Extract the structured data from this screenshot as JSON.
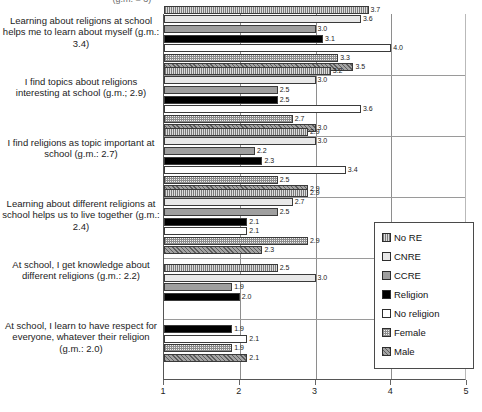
{
  "clipped_title": "(g.m. = 3)",
  "chart_data": {
    "type": "bar",
    "orientation": "horizontal",
    "title": "",
    "xlabel": "",
    "ylabel": "",
    "xlim": [
      1,
      5
    ],
    "xticks": [
      "1",
      "2",
      "3",
      "4",
      "5"
    ],
    "grid": true,
    "legend_position": "right",
    "legend": [
      "No RE",
      "CNRE",
      "CCRE",
      "Religion",
      "No religion",
      "Female",
      "Male"
    ],
    "series_order": [
      "No RE",
      "CNRE",
      "CCRE",
      "Religion",
      "No religion",
      "Female",
      "Male"
    ],
    "categories": [
      "Learning about religions at school helps me to learn about myself (g.m.: 3.4)",
      "I find topics about religions interesting at school (g.m.; 2.9)",
      "I find religions as topic important at school (g.m.: 2.7)",
      "Learning about different religions at school helps us to live together (g.m.: 2.4)",
      "At school, I get knowledge about different religions (g.m.: 2.2)",
      "At school, I learn to have respect for everyone, whatever their religion (g.m.: 2.0)"
    ],
    "series": [
      {
        "name": "No RE",
        "values": [
          3.7,
          3.2,
          2.9,
          2.9,
          3.0,
          2.1
        ]
      },
      {
        "name": "CNRE",
        "values": [
          3.6,
          3.0,
          3.0,
          2.7,
          1.9,
          1.9
        ]
      },
      {
        "name": "CCRE",
        "values": [
          3.0,
          2.5,
          2.2,
          2.5,
          2.0,
          2.1
        ]
      },
      {
        "name": "Religion",
        "values": [
          3.1,
          2.5,
          2.3,
          2.1,
          null,
          1.9
        ]
      },
      {
        "name": "No religion",
        "values": [
          4.0,
          3.6,
          3.4,
          2.1,
          null,
          2.1
        ]
      },
      {
        "name": "Female",
        "values": [
          3.3,
          2.7,
          2.5,
          2.9,
          null,
          null
        ]
      },
      {
        "name": "Male",
        "values": [
          3.5,
          3.0,
          2.9,
          2.5,
          null,
          null
        ]
      }
    ],
    "groups": [
      {
        "label": "Learning about religions at school helps me to learn about myself (g.m.: 3.4)",
        "bars": [
          {
            "series": "No RE",
            "value": 3.7,
            "label": "3.7"
          },
          {
            "series": "CNRE",
            "value": 3.6,
            "label": "3.6"
          },
          {
            "series": "CCRE",
            "value": 3.0,
            "label": "3.0"
          },
          {
            "series": "Religion",
            "value": 3.1,
            "label": "3.1"
          },
          {
            "series": "No religion",
            "value": 4.0,
            "label": "4.0"
          },
          {
            "series": "Female",
            "value": 3.3,
            "label": "3.3"
          },
          {
            "series": "Male",
            "value": 3.5,
            "label": "3.5"
          }
        ]
      },
      {
        "label": "I find topics about religions interesting at school (g.m.; 2.9)",
        "bars": [
          {
            "series": "No RE",
            "value": 3.2,
            "label": "3.2"
          },
          {
            "series": "CNRE",
            "value": 3.0,
            "label": "3.0"
          },
          {
            "series": "CCRE",
            "value": 2.5,
            "label": "2.5"
          },
          {
            "series": "Religion",
            "value": 2.5,
            "label": "2.5"
          },
          {
            "series": "No religion",
            "value": 3.6,
            "label": "3.6"
          },
          {
            "series": "Female",
            "value": 2.7,
            "label": "2.7"
          },
          {
            "series": "Male",
            "value": 3.0,
            "label": "3.0"
          }
        ]
      },
      {
        "label": "I find religions as topic important at school (g.m.: 2.7)",
        "bars": [
          {
            "series": "No RE",
            "value": 2.9,
            "label": "2.9"
          },
          {
            "series": "CNRE",
            "value": 3.0,
            "label": "3.0"
          },
          {
            "series": "CCRE",
            "value": 2.2,
            "label": "2.2"
          },
          {
            "series": "Religion",
            "value": 2.3,
            "label": "2.3"
          },
          {
            "series": "No religion",
            "value": 3.4,
            "label": "3.4"
          },
          {
            "series": "Female",
            "value": 2.5,
            "label": "2.5"
          },
          {
            "series": "Male",
            "value": 2.9,
            "label": "2.9"
          }
        ]
      },
      {
        "label": "Learning about different religions at school helps us to live together (g.m.: 2.4)",
        "bars": [
          {
            "series": "No RE",
            "value": 2.9,
            "label": "2.9"
          },
          {
            "series": "CNRE",
            "value": 2.7,
            "label": "2.7"
          },
          {
            "series": "CCRE",
            "value": 2.5,
            "label": "2.5"
          },
          {
            "series": "Religion",
            "value": 2.1,
            "label": "2.1"
          },
          {
            "series": "No religion",
            "value": 2.1,
            "label": "2.1"
          },
          {
            "series": "Female",
            "value": 2.9,
            "label": "2.9"
          },
          {
            "series": "Male",
            "value": 2.3,
            "label": "2.3"
          }
        ]
      },
      {
        "label": "At school, I get knowledge about different religions (g.m.: 2.2)",
        "bars": [
          {
            "series": "No RE",
            "value": 2.5,
            "label": "2.5"
          },
          {
            "series": "CNRE",
            "value": 3.0,
            "label": "3.0"
          },
          {
            "series": "CCRE",
            "value": 1.9,
            "label": "1.9"
          },
          {
            "series": "Religion",
            "value": 2.0,
            "label": "2.0"
          }
        ]
      },
      {
        "label": "At school, I learn to have respect for everyone, whatever their religion (g.m.: 2.0)",
        "bars": [
          {
            "series": "Religion",
            "value": 1.9,
            "label": "1.9"
          },
          {
            "series": "No religion",
            "value": 2.1,
            "label": "2.1"
          },
          {
            "series": "Female",
            "value": 1.9,
            "label": "1.9"
          },
          {
            "series": "Male",
            "value": 2.1,
            "label": "2.1"
          }
        ]
      }
    ]
  }
}
